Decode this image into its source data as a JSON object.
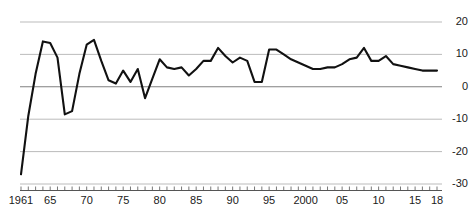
{
  "chart_data": {
    "type": "line",
    "title": "",
    "subtitle": "",
    "xlabel": "",
    "ylabel": "",
    "grid": true,
    "legend": false,
    "legend_position": "none",
    "line_color": "#111111",
    "grid_color": "#b3b3b3",
    "zero_line_color": "#808080",
    "axis_color": "#555555",
    "xlim": [
      1961,
      2018
    ],
    "ylim": [
      -30,
      20
    ],
    "ytick_values": [
      20,
      10,
      0,
      -10,
      -20,
      -30
    ],
    "ytick_labels": [
      "20",
      "10",
      "0",
      "-10",
      "-20",
      "-30"
    ],
    "xtick_values": [
      1961,
      1965,
      1970,
      1975,
      1980,
      1985,
      1990,
      1995,
      2000,
      2005,
      2010,
      2015,
      2018
    ],
    "xtick_labels": [
      "1961",
      "65",
      "70",
      "75",
      "80",
      "85",
      "90",
      "95",
      "2000",
      "05",
      "10",
      "15",
      "18"
    ],
    "x": [
      1961,
      1962,
      1963,
      1964,
      1965,
      1966,
      1967,
      1968,
      1969,
      1970,
      1971,
      1972,
      1973,
      1974,
      1975,
      1976,
      1977,
      1978,
      1979,
      1980,
      1981,
      1982,
      1983,
      1984,
      1985,
      1986,
      1987,
      1988,
      1989,
      1990,
      1991,
      1992,
      1993,
      1994,
      1995,
      1996,
      1997,
      1998,
      1999,
      2000,
      2001,
      2002,
      2003,
      2004,
      2005,
      2006,
      2007,
      2008,
      2009,
      2010,
      2011,
      2012,
      2013,
      2014,
      2015,
      2016,
      2017,
      2018
    ],
    "series": [
      {
        "name": "Annual growth rate",
        "values": [
          -27.0,
          -9.0,
          4.0,
          14.0,
          13.5,
          9.0,
          -8.5,
          -7.5,
          4.0,
          13.0,
          14.5,
          8.0,
          2.0,
          1.0,
          5.0,
          1.5,
          5.5,
          -3.5,
          2.5,
          8.5,
          6.0,
          5.5,
          6.0,
          3.5,
          5.5,
          8.0,
          8.0,
          12.0,
          9.5,
          7.5,
          9.0,
          8.0,
          1.5,
          1.5,
          11.5,
          11.5,
          10.0,
          8.5,
          7.5,
          6.5,
          5.5,
          5.5,
          6.0,
          6.0,
          7.0,
          8.5,
          9.0,
          12.0,
          8.0,
          8.0,
          9.5,
          7.0,
          6.5,
          6.0,
          5.5,
          5.0,
          5.0,
          5.0
        ]
      }
    ]
  },
  "axes": {
    "y_axis_name": "value-axis",
    "x_axis_name": "year-axis"
  }
}
